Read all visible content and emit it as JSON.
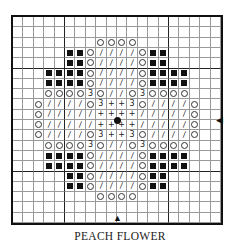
{
  "title": "PEACH FLOWER",
  "grid": {
    "cols": 20,
    "rows": 20,
    "thick_every": 10,
    "thick_cols_after": [
      4,
      14
    ],
    "thick_rows_after": [
      4,
      14
    ]
  },
  "legend_symbols": {
    "F": "filled-square",
    "O": "circle",
    "/": "slash",
    "+": "plus",
    "3": "three"
  },
  "pattern": [
    "....................",
    "....................",
    "........OOOO........",
    ".....FFO////OFF.....",
    ".....FFO////OFF.....",
    "...FFFFO////OFFFF...",
    "...FFFFO////OFFFF...",
    "...OOOO3O//O3OOOO...",
    "..O////O3++3O////O..",
    "..O/////++++/////O..",
    "..O/////++++/////O..",
    "..O////O3++3O////O..",
    "...OOOO3O//O3OOOO...",
    "...FFFFO////OFFFF...",
    "...FFFFO////OFFFF...",
    ".....FFO////OFF.....",
    ".....FFO////OFF.....",
    "........OOOO........",
    "....................",
    "...................."
  ],
  "markers": {
    "center": "center-dot",
    "right_arrow": "◀",
    "bottom_arrow": "▲"
  }
}
